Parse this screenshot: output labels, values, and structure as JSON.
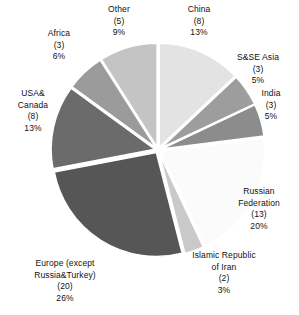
{
  "chart_data": {
    "type": "pie",
    "title": "",
    "subtitle": "",
    "xlabel": "",
    "ylabel": "",
    "legend_position": "callout-labels",
    "grid": false,
    "start_angle_deg": 0,
    "direction": "clockwise",
    "exploded": true,
    "total_count": 67,
    "categories": [
      "China",
      "S&SE Asia",
      "India",
      "Russian Federation",
      "Islamic Republic of Iran",
      "Europe (except Russia&Turkey)",
      "USA& Canada",
      "Africa",
      "Other"
    ],
    "values": [
      13,
      5,
      5,
      20,
      3,
      26,
      13,
      6,
      9
    ],
    "counts": [
      8,
      3,
      3,
      13,
      2,
      20,
      8,
      3,
      5
    ],
    "slices": [
      {
        "id": "china",
        "label": "China",
        "count_text": "(8)",
        "percent_text": "13%",
        "count": 8,
        "percent": 13,
        "color": "#e3e3e3",
        "label_align": "center"
      },
      {
        "id": "ssea",
        "label": "S&SE Asia",
        "count_text": "(3)",
        "percent_text": "5%",
        "count": 3,
        "percent": 5,
        "color": "#9d9d9d",
        "label_align": "center"
      },
      {
        "id": "india",
        "label": "India",
        "count_text": "(3)",
        "percent_text": "5%",
        "count": 3,
        "percent": 5,
        "color": "#8c8c8c",
        "label_align": "center"
      },
      {
        "id": "russia",
        "label_line1": "Russian",
        "label_line2": "Federation",
        "count_text": "(13)",
        "percent_text": "20%",
        "count": 13,
        "percent": 20,
        "color": "#fbfbfb",
        "label_align": "center"
      },
      {
        "id": "iran",
        "label_line1": "Islamic Republic",
        "label_line2": "of Iran",
        "count_text": "(2)",
        "percent_text": "3%",
        "count": 2,
        "percent": 3,
        "color": "#c9c9c9",
        "label_align": "center"
      },
      {
        "id": "europe",
        "label_line1": "Europe (except",
        "label_line2": "Russia&Turkey)",
        "count_text": "(20)",
        "percent_text": "26%",
        "count": 20,
        "percent": 26,
        "color": "#565656",
        "label_align": "center"
      },
      {
        "id": "usa-canada",
        "label_line1": "USA&",
        "label_line2": "Canada",
        "count_text": "(8)",
        "percent_text": "13%",
        "count": 8,
        "percent": 13,
        "color": "#6b6b6b",
        "label_align": "center"
      },
      {
        "id": "africa",
        "label": "Africa",
        "count_text": "(3)",
        "percent_text": "6%",
        "count": 3,
        "percent": 6,
        "color": "#9b9b9b",
        "label_align": "center"
      },
      {
        "id": "other",
        "label": "Other",
        "count_text": "(5)",
        "percent_text": "9%",
        "count": 5,
        "percent": 9,
        "color": "#c4c4c4",
        "label_align": "center"
      }
    ],
    "geometry": {
      "center_x": 158,
      "center_y": 150,
      "radius": 104,
      "explode_offset": 3,
      "separator_color": "#ffffff"
    },
    "background_color": "#ffffff",
    "text_color": "#111111"
  }
}
